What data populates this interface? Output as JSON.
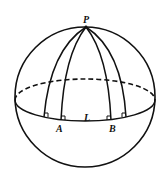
{
  "diagram": {
    "title": "",
    "labels": {
      "pole": "P",
      "point_a": "A",
      "point_b": "B",
      "equator": "L"
    },
    "colors": {
      "stroke": "#111111",
      "background": "#ffffff"
    },
    "elements": [
      "sphere-outline",
      "equator-back-dashed",
      "equator-front-solid",
      "four-meridian-arcs-from-P",
      "right-angle-markers-at-equator"
    ]
  }
}
